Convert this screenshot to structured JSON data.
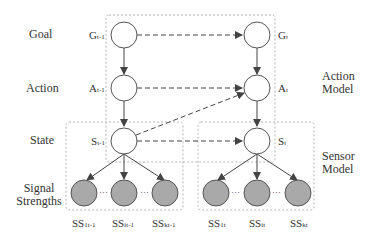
{
  "rows": {
    "goal": "Goal",
    "action": "Action",
    "state": "State",
    "signal_line1": "Signal",
    "signal_line2": "Strengths"
  },
  "models": {
    "action_line1": "Action",
    "action_line2": "Model",
    "sensor_line1": "Sensor",
    "sensor_line2": "Model"
  },
  "nodes": {
    "g_prev": {
      "base": "G",
      "sub": "t-1"
    },
    "a_prev": {
      "base": "A",
      "sub": "t-1"
    },
    "s_prev": {
      "base": "S",
      "sub": "t-1"
    },
    "g_cur": {
      "base": "G",
      "sub": "t"
    },
    "a_cur": {
      "base": "A",
      "sub": "t"
    },
    "s_cur": {
      "base": "S",
      "sub": "t"
    },
    "ss_prev": [
      {
        "base": "SS",
        "sub": "1t-1"
      },
      {
        "base": "SS",
        "sub": "it-1"
      },
      {
        "base": "SS",
        "sub": "kt-1"
      }
    ],
    "ss_cur": [
      {
        "base": "SS",
        "sub": "1t"
      },
      {
        "base": "SS",
        "sub": "it"
      },
      {
        "base": "SS",
        "sub": "kt"
      }
    ]
  },
  "ellipsis": "···",
  "colors": {
    "observed_fill": "#a9a9a9",
    "hidden_fill": "#ffffff",
    "stroke": "#555555",
    "box_dash": "#b0b0b0"
  }
}
